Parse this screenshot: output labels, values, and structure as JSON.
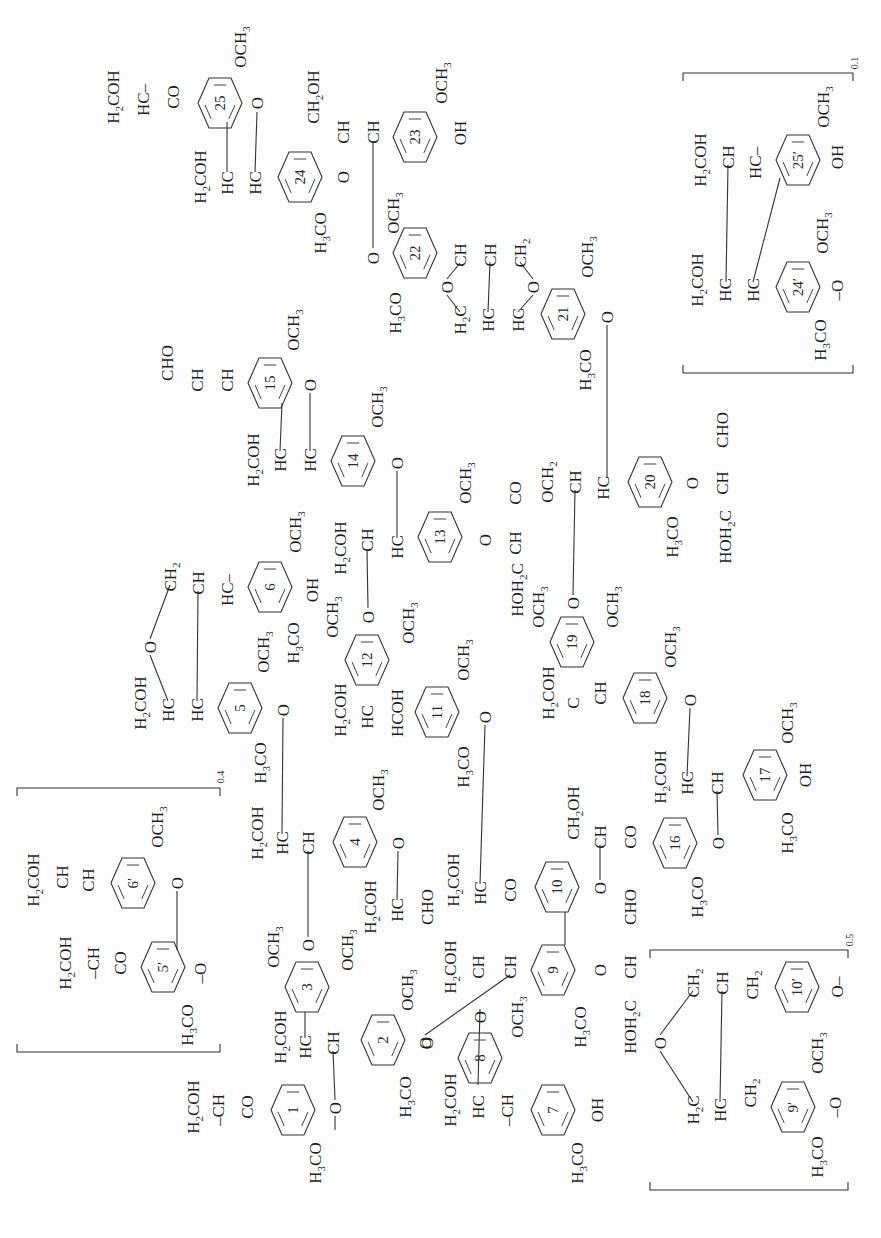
{
  "diagram": {
    "title": "Lignin structural model",
    "orientation": "rotated -90deg",
    "colors": {
      "ink": "#1e1e1e",
      "background": "#fdfdfd"
    }
  },
  "rings": [
    {
      "id": "1",
      "x": 293,
      "y": 1110
    },
    {
      "id": "2",
      "x": 383,
      "y": 1040
    },
    {
      "id": "3",
      "x": 307,
      "y": 987
    },
    {
      "id": "4",
      "x": 355,
      "y": 842
    },
    {
      "id": "5",
      "x": 240,
      "y": 708
    },
    {
      "id": "6",
      "x": 270,
      "y": 587
    },
    {
      "id": "7",
      "x": 553,
      "y": 1110
    },
    {
      "id": "8",
      "x": 480,
      "y": 1058
    },
    {
      "id": "9",
      "x": 553,
      "y": 970
    },
    {
      "id": "10",
      "x": 557,
      "y": 887
    },
    {
      "id": "11",
      "x": 437,
      "y": 712
    },
    {
      "id": "12",
      "x": 367,
      "y": 660
    },
    {
      "id": "13",
      "x": 440,
      "y": 537
    },
    {
      "id": "14",
      "x": 353,
      "y": 461
    },
    {
      "id": "15",
      "x": 270,
      "y": 383
    },
    {
      "id": "16",
      "x": 675,
      "y": 843
    },
    {
      "id": "17",
      "x": 765,
      "y": 775
    },
    {
      "id": "18",
      "x": 645,
      "y": 698
    },
    {
      "id": "19",
      "x": 572,
      "y": 642
    },
    {
      "id": "20",
      "x": 650,
      "y": 482
    },
    {
      "id": "21",
      "x": 563,
      "y": 314
    },
    {
      "id": "22",
      "x": 415,
      "y": 253
    },
    {
      "id": "23",
      "x": 415,
      "y": 137
    },
    {
      "id": "24",
      "x": 300,
      "y": 177
    },
    {
      "id": "25",
      "x": 220,
      "y": 103
    },
    {
      "id": "5′",
      "x": 163,
      "y": 967
    },
    {
      "id": "6′",
      "x": 133,
      "y": 883
    },
    {
      "id": "9′",
      "x": 793,
      "y": 1107
    },
    {
      "id": "10′",
      "x": 797,
      "y": 987
    },
    {
      "id": "24′",
      "x": 798,
      "y": 287
    },
    {
      "id": "25′",
      "x": 798,
      "y": 160
    }
  ],
  "labels": [
    {
      "t": "H_2COH",
      "x": 113,
      "y": 97
    },
    {
      "t": "HC–",
      "x": 143,
      "y": 100
    },
    {
      "t": "CO",
      "x": 173,
      "y": 97
    },
    {
      "t": "OCH_3",
      "x": 240,
      "y": 47
    },
    {
      "t": "O",
      "x": 257,
      "y": 103
    },
    {
      "t": "H_2COH",
      "x": 200,
      "y": 177
    },
    {
      "t": "HC",
      "x": 227,
      "y": 183
    },
    {
      "t": "HC",
      "x": 255,
      "y": 183
    },
    {
      "t": "O",
      "x": 343,
      "y": 177
    },
    {
      "t": "H_3CO",
      "x": 320,
      "y": 233
    },
    {
      "t": "CH_2OH",
      "x": 313,
      "y": 97
    },
    {
      "t": "CH",
      "x": 343,
      "y": 132
    },
    {
      "t": "CH",
      "x": 373,
      "y": 132
    },
    {
      "t": "OCH_3",
      "x": 441,
      "y": 83
    },
    {
      "t": "OH",
      "x": 460,
      "y": 133
    },
    {
      "t": "OCH_3",
      "x": 393,
      "y": 213
    },
    {
      "t": "O",
      "x": 373,
      "y": 258
    },
    {
      "t": "H_3CO",
      "x": 395,
      "y": 313
    },
    {
      "t": "CH",
      "x": 460,
      "y": 255
    },
    {
      "t": "CH",
      "x": 490,
      "y": 255
    },
    {
      "t": "CH_2",
      "x": 520,
      "y": 253
    },
    {
      "t": "O",
      "x": 447,
      "y": 287
    },
    {
      "t": "O",
      "x": 533,
      "y": 287
    },
    {
      "t": "H_2C",
      "x": 460,
      "y": 320
    },
    {
      "t": "HC",
      "x": 488,
      "y": 320
    },
    {
      "t": "HC",
      "x": 518,
      "y": 320
    },
    {
      "t": "OCH_3",
      "x": 587,
      "y": 257
    },
    {
      "t": "O",
      "x": 607,
      "y": 317
    },
    {
      "t": "H_3CO",
      "x": 585,
      "y": 370
    },
    {
      "t": "CHO",
      "x": 167,
      "y": 363
    },
    {
      "t": "CH",
      "x": 197,
      "y": 380
    },
    {
      "t": "CH",
      "x": 227,
      "y": 380
    },
    {
      "t": "OCH_3",
      "x": 293,
      "y": 330
    },
    {
      "t": "O",
      "x": 310,
      "y": 385
    },
    {
      "t": "H_2COH",
      "x": 253,
      "y": 460
    },
    {
      "t": "HC",
      "x": 280,
      "y": 460
    },
    {
      "t": "HC",
      "x": 310,
      "y": 460
    },
    {
      "t": "OCH_3",
      "x": 377,
      "y": 407
    },
    {
      "t": "O",
      "x": 397,
      "y": 463
    },
    {
      "t": "CH_2",
      "x": 170,
      "y": 577
    },
    {
      "t": "CH",
      "x": 198,
      "y": 583
    },
    {
      "t": "HC–",
      "x": 227,
      "y": 590
    },
    {
      "t": "OCH_3",
      "x": 295,
      "y": 532
    },
    {
      "t": "OH",
      "x": 312,
      "y": 590
    },
    {
      "t": "H_3CO",
      "x": 293,
      "y": 643
    },
    {
      "t": "O",
      "x": 150,
      "y": 647
    },
    {
      "t": "H_2COH",
      "x": 140,
      "y": 703
    },
    {
      "t": "HC",
      "x": 168,
      "y": 710
    },
    {
      "t": "HC",
      "x": 197,
      "y": 710
    },
    {
      "t": "OCH_3",
      "x": 263,
      "y": 652
    },
    {
      "t": "O",
      "x": 283,
      "y": 710
    },
    {
      "t": "H_3CO",
      "x": 260,
      "y": 763
    },
    {
      "t": "H_2COH",
      "x": 340,
      "y": 548
    },
    {
      "t": "CH",
      "x": 367,
      "y": 540
    },
    {
      "t": "HC",
      "x": 397,
      "y": 547
    },
    {
      "t": "OCH_3",
      "x": 465,
      "y": 483
    },
    {
      "t": "O",
      "x": 485,
      "y": 540
    },
    {
      "t": "CH",
      "x": 515,
      "y": 543
    },
    {
      "t": "CO",
      "x": 515,
      "y": 493
    },
    {
      "t": "OCH_2",
      "x": 547,
      "y": 482
    },
    {
      "t": "CH",
      "x": 575,
      "y": 482
    },
    {
      "t": "HC",
      "x": 603,
      "y": 488
    },
    {
      "t": "H_3CO",
      "x": 672,
      "y": 537
    },
    {
      "t": "O",
      "x": 692,
      "y": 483
    },
    {
      "t": "CH",
      "x": 722,
      "y": 483
    },
    {
      "t": "CHO",
      "x": 722,
      "y": 430
    },
    {
      "t": "HOH_2C",
      "x": 725,
      "y": 537
    },
    {
      "t": "OCH_3",
      "x": 332,
      "y": 617
    },
    {
      "t": "O",
      "x": 368,
      "y": 617
    },
    {
      "t": "OCH_3",
      "x": 408,
      "y": 623
    },
    {
      "t": "H_2COH",
      "x": 340,
      "y": 710
    },
    {
      "t": "HC",
      "x": 367,
      "y": 717
    },
    {
      "t": "HCOH",
      "x": 397,
      "y": 713
    },
    {
      "t": "OCH_3",
      "x": 463,
      "y": 660
    },
    {
      "t": "O",
      "x": 485,
      "y": 717
    },
    {
      "t": "H_3CO",
      "x": 463,
      "y": 767
    },
    {
      "t": "HOH_2C",
      "x": 517,
      "y": 590
    },
    {
      "t": "OCH_3",
      "x": 538,
      "y": 607
    },
    {
      "t": "O",
      "x": 573,
      "y": 603
    },
    {
      "t": "OCH_3",
      "x": 612,
      "y": 607
    },
    {
      "t": "H_2COH",
      "x": 548,
      "y": 693
    },
    {
      "t": "C",
      "x": 573,
      "y": 703
    },
    {
      "t": "CH",
      "x": 600,
      "y": 693
    },
    {
      "t": "OCH_3",
      "x": 670,
      "y": 647
    },
    {
      "t": "O",
      "x": 690,
      "y": 700
    },
    {
      "t": "H_2COH",
      "x": 660,
      "y": 777
    },
    {
      "t": "HC",
      "x": 687,
      "y": 783
    },
    {
      "t": "CH",
      "x": 717,
      "y": 783
    },
    {
      "t": "OCH_3",
      "x": 787,
      "y": 723
    },
    {
      "t": "OH",
      "x": 805,
      "y": 775
    },
    {
      "t": "H_3CO",
      "x": 787,
      "y": 833
    },
    {
      "t": "H_2COH",
      "x": 257,
      "y": 833
    },
    {
      "t": "HC",
      "x": 282,
      "y": 843
    },
    {
      "t": "CH",
      "x": 308,
      "y": 843
    },
    {
      "t": "OCH_3",
      "x": 378,
      "y": 790
    },
    {
      "t": "O",
      "x": 398,
      "y": 843
    },
    {
      "t": "H_2COH",
      "x": 370,
      "y": 907
    },
    {
      "t": "HC",
      "x": 397,
      "y": 910
    },
    {
      "t": "CHO",
      "x": 427,
      "y": 907
    },
    {
      "t": "OCH_3",
      "x": 273,
      "y": 947
    },
    {
      "t": "O",
      "x": 308,
      "y": 945
    },
    {
      "t": "OCH_3",
      "x": 347,
      "y": 950
    },
    {
      "t": "H_2COH",
      "x": 280,
      "y": 1037
    },
    {
      "t": "HC",
      "x": 305,
      "y": 1047
    },
    {
      "t": "CH",
      "x": 333,
      "y": 1043
    },
    {
      "t": "OCH_3",
      "x": 407,
      "y": 990
    },
    {
      "t": "O",
      "x": 425,
      "y": 1043
    },
    {
      "t": "H_3CO",
      "x": 405,
      "y": 1097
    },
    {
      "t": "H_2COH",
      "x": 193,
      "y": 1107
    },
    {
      "t": "–CH",
      "x": 218,
      "y": 1110
    },
    {
      "t": "CO",
      "x": 247,
      "y": 1107
    },
    {
      "t": "O",
      "x": 335,
      "y": 1108
    },
    {
      "t": "H_3CO",
      "x": 315,
      "y": 1163
    },
    {
      "t": "H_2COH",
      "x": 33,
      "y": 880
    },
    {
      "t": "CH",
      "x": 62,
      "y": 877
    },
    {
      "t": "CH",
      "x": 88,
      "y": 880
    },
    {
      "t": "OCH_3",
      "x": 157,
      "y": 827
    },
    {
      "t": "O",
      "x": 177,
      "y": 883
    },
    {
      "t": "H_2COH",
      "x": 65,
      "y": 963
    },
    {
      "t": "–CH",
      "x": 93,
      "y": 963
    },
    {
      "t": "CO",
      "x": 120,
      "y": 963
    },
    {
      "t": "–O",
      "x": 200,
      "y": 973
    },
    {
      "t": "H_3CO",
      "x": 187,
      "y": 1025
    },
    {
      "t": "H_2COH",
      "x": 453,
      "y": 880
    },
    {
      "t": "HC",
      "x": 480,
      "y": 893
    },
    {
      "t": "CO",
      "x": 510,
      "y": 890
    },
    {
      "t": "O",
      "x": 600,
      "y": 888
    },
    {
      "t": "CH_2OH",
      "x": 573,
      "y": 813
    },
    {
      "t": "CH",
      "x": 600,
      "y": 837
    },
    {
      "t": "CO",
      "x": 630,
      "y": 837
    },
    {
      "t": "O",
      "x": 718,
      "y": 843
    },
    {
      "t": "H_3CO",
      "x": 697,
      "y": 897
    },
    {
      "t": "H_2COH",
      "x": 450,
      "y": 967
    },
    {
      "t": "CH",
      "x": 478,
      "y": 967
    },
    {
      "t": "CH",
      "x": 510,
      "y": 967
    },
    {
      "t": "O",
      "x": 600,
      "y": 970
    },
    {
      "t": "CH",
      "x": 630,
      "y": 967
    },
    {
      "t": "CHO",
      "x": 630,
      "y": 907
    },
    {
      "t": "HOH_2C",
      "x": 630,
      "y": 1027
    },
    {
      "t": "H_3CO",
      "x": 580,
      "y": 1027
    },
    {
      "t": "OCH_3",
      "x": 517,
      "y": 1017
    },
    {
      "t": "O",
      "x": 480,
      "y": 1017
    },
    {
      "t": "O",
      "x": 427,
      "y": 1043
    },
    {
      "t": "H_2COH",
      "x": 450,
      "y": 1100
    },
    {
      "t": "HC",
      "x": 478,
      "y": 1107
    },
    {
      "t": "–CH",
      "x": 507,
      "y": 1110
    },
    {
      "t": "OH",
      "x": 597,
      "y": 1110
    },
    {
      "t": "H_3CO",
      "x": 577,
      "y": 1163
    },
    {
      "t": "O",
      "x": 660,
      "y": 1043
    },
    {
      "t": "CH_2",
      "x": 693,
      "y": 983
    },
    {
      "t": "CH",
      "x": 722,
      "y": 983
    },
    {
      "t": "CH_2",
      "x": 752,
      "y": 985
    },
    {
      "t": "O–",
      "x": 837,
      "y": 987
    },
    {
      "t": "H_2C",
      "x": 693,
      "y": 1110
    },
    {
      "t": "HC",
      "x": 720,
      "y": 1110
    },
    {
      "t": "CH_2",
      "x": 750,
      "y": 1093
    },
    {
      "t": "OCH_3",
      "x": 817,
      "y": 1053
    },
    {
      "t": "–O",
      "x": 835,
      "y": 1107
    },
    {
      "t": "H_3CO",
      "x": 817,
      "y": 1157
    },
    {
      "t": "H_2COH",
      "x": 700,
      "y": 160
    },
    {
      "t": "CH",
      "x": 728,
      "y": 157
    },
    {
      "t": "HC–",
      "x": 755,
      "y": 163
    },
    {
      "t": "OCH_3",
      "x": 823,
      "y": 107
    },
    {
      "t": "OH",
      "x": 837,
      "y": 157
    },
    {
      "t": "H_2COH",
      "x": 697,
      "y": 280
    },
    {
      "t": "HC",
      "x": 725,
      "y": 290
    },
    {
      "t": "HC",
      "x": 753,
      "y": 290
    },
    {
      "t": "OCH_3",
      "x": 822,
      "y": 233
    },
    {
      "t": "–O",
      "x": 837,
      "y": 290
    },
    {
      "t": "H_3CO",
      "x": 820,
      "y": 340
    }
  ],
  "bonds": [
    [
      227,
      122,
      227,
      172
    ],
    [
      257,
      112,
      255,
      172
    ],
    [
      373,
      142,
      373,
      248
    ],
    [
      490,
      262,
      488,
      312
    ],
    [
      447,
      279,
      460,
      263
    ],
    [
      447,
      295,
      460,
      312
    ],
    [
      533,
      279,
      520,
      262
    ],
    [
      533,
      295,
      518,
      312
    ],
    [
      607,
      325,
      607,
      478
    ],
    [
      728,
      165,
      726,
      282
    ],
    [
      780,
      178,
      753,
      282
    ],
    [
      282,
      403,
      280,
      451
    ],
    [
      310,
      393,
      310,
      451
    ],
    [
      397,
      471,
      397,
      538
    ],
    [
      367,
      550,
      368,
      608
    ],
    [
      150,
      639,
      170,
      585
    ],
    [
      150,
      655,
      168,
      701
    ],
    [
      198,
      591,
      197,
      701
    ],
    [
      283,
      718,
      282,
      834
    ],
    [
      485,
      725,
      480,
      884
    ],
    [
      398,
      851,
      397,
      900
    ],
    [
      308,
      937,
      308,
      851
    ],
    [
      305,
      1012,
      305,
      1038
    ],
    [
      333,
      1051,
      335,
      1100
    ],
    [
      425,
      1035,
      510,
      975
    ],
    [
      480,
      1009,
      478,
      1085
    ],
    [
      565,
      945,
      565,
      912
    ],
    [
      600,
      880,
      600,
      845
    ],
    [
      718,
      835,
      717,
      791
    ],
    [
      690,
      708,
      687,
      776
    ],
    [
      573,
      595,
      575,
      490
    ],
    [
      660,
      1035,
      693,
      991
    ],
    [
      660,
      1051,
      693,
      1102
    ],
    [
      722,
      991,
      720,
      1102
    ],
    [
      177,
      891,
      177,
      950
    ],
    [
      335,
      1116,
      335,
      1130
    ]
  ],
  "brackets": [
    {
      "name": "bracket-unit-0.4",
      "x1": 17,
      "y1": 788,
      "x2": 220,
      "y2": 1052,
      "sub": "0.4",
      "sx": 224,
      "sy": 777
    },
    {
      "name": "bracket-unit-0.5",
      "x1": 650,
      "y1": 950,
      "x2": 848,
      "y2": 1190,
      "sub": "0.5",
      "sx": 853,
      "sy": 940
    },
    {
      "name": "bracket-unit-0.1",
      "x1": 683,
      "y1": 73,
      "x2": 853,
      "y2": 373,
      "sub": "0.1",
      "sx": 858,
      "sy": 63
    }
  ]
}
